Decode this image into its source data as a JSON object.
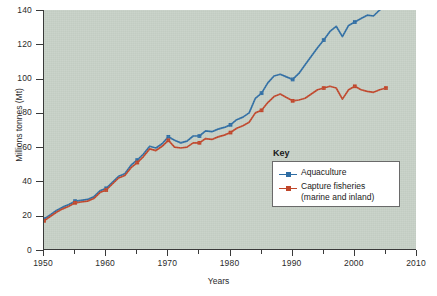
{
  "chart_data": {
    "type": "line",
    "title": "",
    "xlabel": "Years",
    "ylabel": "Millions tonnes (Mt)",
    "xlim": [
      1950,
      2010
    ],
    "ylim": [
      0,
      140
    ],
    "xticks": [
      1950,
      1960,
      1970,
      1980,
      1990,
      2000,
      2010
    ],
    "xtick_labels": [
      "1950",
      "1960",
      "1970",
      "1980",
      "1990",
      "2000",
      "2010"
    ],
    "xminor_ticks": [
      1955,
      1965,
      1975,
      1985,
      1995,
      2005
    ],
    "yticks": [
      0,
      20,
      40,
      60,
      80,
      100,
      120,
      140
    ],
    "ytick_labels": [
      "0",
      "20",
      "40",
      "60",
      "80",
      "100",
      "120",
      "140"
    ],
    "grid": false,
    "legend_position": "inside-lower-right",
    "legend_title": "Key",
    "background_color": "#c6d0c6",
    "x": [
      1950,
      1951,
      1952,
      1953,
      1954,
      1955,
      1956,
      1957,
      1958,
      1959,
      1960,
      1961,
      1962,
      1963,
      1964,
      1965,
      1966,
      1967,
      1968,
      1969,
      1970,
      1971,
      1972,
      1973,
      1974,
      1975,
      1976,
      1977,
      1978,
      1979,
      1980,
      1981,
      1982,
      1983,
      1984,
      1985,
      1986,
      1987,
      1988,
      1989,
      1990,
      1991,
      1992,
      1993,
      1994,
      1995,
      1996,
      1997,
      1998,
      1999,
      2000,
      2001,
      2002,
      2003,
      2004,
      2005
    ],
    "series": [
      {
        "name": "Aquaculture",
        "color": "#2e6da4",
        "marker_years": [
          1950,
          1955,
          1960,
          1965,
          1970,
          1975,
          1980,
          1985,
          1990,
          1995,
          2000,
          2005
        ],
        "values": [
          18,
          20.5,
          23,
          25,
          26.5,
          28.5,
          29,
          29.5,
          31,
          34.5,
          36,
          39.5,
          43,
          44.5,
          49.5,
          52.5,
          56,
          60.5,
          59.5,
          62,
          66,
          64,
          62.5,
          63.5,
          66.5,
          66.5,
          69.5,
          69,
          70.5,
          71.5,
          73,
          76,
          77.5,
          80,
          88.5,
          91.5,
          97.5,
          101.5,
          102.5,
          101,
          99.5,
          103,
          108,
          113,
          118,
          122.5,
          127.5,
          130.5,
          124.5,
          131,
          133,
          135,
          137,
          136.5,
          140,
          143
        ]
      },
      {
        "name": "Capture fisheries (marine and inland)",
        "color": "#c0462a",
        "marker_years": [
          1950,
          1955,
          1960,
          1965,
          1970,
          1975,
          1980,
          1985,
          1990,
          1995,
          2000,
          2005
        ],
        "values": [
          17,
          19.5,
          22,
          24,
          25.5,
          27.5,
          28,
          28.5,
          30,
          33.5,
          35,
          38.5,
          42,
          43.5,
          48,
          51,
          54.5,
          59,
          58,
          60.5,
          64,
          60,
          59.5,
          60,
          62.5,
          62.5,
          65,
          64.5,
          66,
          67,
          68.5,
          71,
          72.5,
          74.5,
          80,
          81.5,
          86,
          89.5,
          91,
          89,
          87,
          87.5,
          88.5,
          91,
          93.5,
          94.5,
          95.5,
          94.5,
          88,
          93.5,
          95.5,
          93.5,
          92.5,
          92,
          93.5,
          94.5
        ]
      }
    ],
    "legend": [
      {
        "label": "Aquaculture",
        "label_line2": "",
        "color": "#2e6da4"
      },
      {
        "label": "Capture fisheries",
        "label_line2": "(marine and inland)",
        "color": "#c0462a"
      }
    ]
  }
}
